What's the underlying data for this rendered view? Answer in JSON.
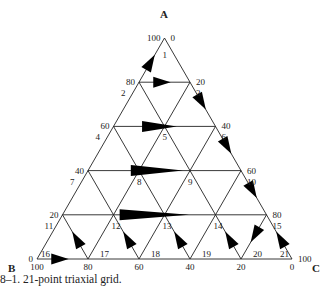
{
  "figure": {
    "caption": "8–1.  21-point triaxial grid.",
    "vertices": {
      "A": "A",
      "B": "B",
      "C": "C"
    },
    "line_color": "#222222",
    "arrow_color": "#000000"
  },
  "chart_data": {
    "type": "ternary",
    "title": "21-point triaxial grid",
    "axes": [
      "A",
      "B",
      "C"
    ],
    "grid_step": 20,
    "left_edge_ticks": [
      "100",
      "80",
      "60",
      "40",
      "20",
      "0"
    ],
    "right_edge_ticks": [
      "0",
      "20",
      "40",
      "60",
      "80",
      "100"
    ],
    "bottom_edge_ticks": [
      "100",
      "80",
      "60",
      "40",
      "20",
      "0"
    ],
    "points": [
      {
        "id": "1",
        "a": 100,
        "b": 0,
        "c": 0
      },
      {
        "id": "2",
        "a": 80,
        "b": 20,
        "c": 0
      },
      {
        "id": "3",
        "a": 80,
        "b": 0,
        "c": 20
      },
      {
        "id": "4",
        "a": 60,
        "b": 40,
        "c": 0
      },
      {
        "id": "5",
        "a": 60,
        "b": 20,
        "c": 20
      },
      {
        "id": "6",
        "a": 60,
        "b": 0,
        "c": 40
      },
      {
        "id": "7",
        "a": 40,
        "b": 60,
        "c": 0
      },
      {
        "id": "8",
        "a": 40,
        "b": 40,
        "c": 20
      },
      {
        "id": "9",
        "a": 40,
        "b": 20,
        "c": 40
      },
      {
        "id": "10",
        "a": 40,
        "b": 0,
        "c": 60
      },
      {
        "id": "11",
        "a": 20,
        "b": 80,
        "c": 0
      },
      {
        "id": "12",
        "a": 20,
        "b": 60,
        "c": 20
      },
      {
        "id": "13",
        "a": 20,
        "b": 40,
        "c": 40
      },
      {
        "id": "14",
        "a": 20,
        "b": 20,
        "c": 60
      },
      {
        "id": "15",
        "a": 20,
        "b": 0,
        "c": 80
      },
      {
        "id": "16",
        "a": 0,
        "b": 100,
        "c": 0
      },
      {
        "id": "17",
        "a": 0,
        "b": 80,
        "c": 20
      },
      {
        "id": "18",
        "a": 0,
        "b": 60,
        "c": 40
      },
      {
        "id": "19",
        "a": 0,
        "b": 40,
        "c": 60
      },
      {
        "id": "20",
        "a": 0,
        "b": 20,
        "c": 80
      },
      {
        "id": "21",
        "a": 0,
        "b": 0,
        "c": 100
      }
    ],
    "arrows": [
      {
        "from": [
          80,
          20,
          0
        ],
        "to": [
          100,
          0,
          0
        ],
        "label_point": "1"
      },
      {
        "from": [
          80,
          20,
          0
        ],
        "to": [
          80,
          0,
          20
        ],
        "label_point": "2"
      },
      {
        "from": [
          80,
          0,
          20
        ],
        "to": [
          60,
          0,
          40
        ],
        "label_point": "3"
      },
      {
        "from": [
          60,
          40,
          0
        ],
        "to": [
          60,
          0,
          40
        ],
        "label_point": "4"
      },
      {
        "from": [
          60,
          0,
          40
        ],
        "to": [
          40,
          0,
          60
        ],
        "label_point": "6"
      },
      {
        "from": [
          40,
          60,
          0
        ],
        "to": [
          40,
          0,
          60
        ],
        "label_point": "7"
      },
      {
        "from": [
          40,
          0,
          60
        ],
        "to": [
          20,
          0,
          80
        ],
        "label_point": "10"
      },
      {
        "from": [
          20,
          80,
          0
        ],
        "to": [
          20,
          0,
          80
        ],
        "label_point": "11"
      },
      {
        "from": [
          0,
          80,
          20
        ],
        "to": [
          20,
          80,
          0
        ],
        "label_point": "11"
      },
      {
        "from": [
          0,
          60,
          40
        ],
        "to": [
          20,
          60,
          20
        ],
        "label_point": "12"
      },
      {
        "from": [
          0,
          40,
          60
        ],
        "to": [
          20,
          40,
          40
        ],
        "label_point": "13"
      },
      {
        "from": [
          0,
          20,
          80
        ],
        "to": [
          20,
          20,
          60
        ],
        "label_point": "14"
      },
      {
        "from": [
          20,
          0,
          80
        ],
        "to": [
          0,
          20,
          80
        ],
        "label_point": "15"
      },
      {
        "from": [
          0,
          0,
          100
        ],
        "to": [
          20,
          0,
          80
        ],
        "label_point": "21"
      },
      {
        "from": [
          0,
          100,
          0
        ],
        "to": [
          0,
          80,
          20
        ],
        "label_point": "16"
      }
    ]
  }
}
